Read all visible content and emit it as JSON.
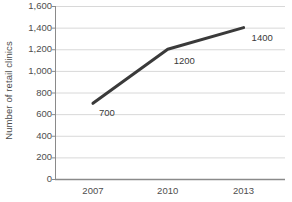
{
  "chart_data": {
    "type": "line",
    "title": "",
    "subtitle": "",
    "xlabel": "",
    "ylabel": "Number of retail clinics",
    "categories": [
      "2007",
      "2010",
      "2013"
    ],
    "x": [
      2007,
      2010,
      2013
    ],
    "values": [
      700,
      1200,
      1400
    ],
    "point_labels": [
      "700",
      "1200",
      "1400"
    ],
    "series": [
      {
        "name": "Number of retail clinics",
        "values": [
          700,
          1200,
          1400
        ]
      }
    ],
    "ylim": [
      0,
      1600
    ],
    "ytick_values": [
      0,
      200,
      400,
      600,
      800,
      1000,
      1200,
      1400,
      1600
    ],
    "ytick_labels": [
      "0",
      "200",
      "400",
      "600",
      "800",
      "1,000",
      "1,200",
      "1,400",
      "1,600"
    ],
    "xtick_labels": [
      "2007",
      "2010",
      "2013"
    ],
    "grid": "horizontal",
    "legend": "none",
    "colors": {
      "line": "#3a3a3a",
      "gridline": "#d8d8d8",
      "axis": "#8a8a8a",
      "label_text": "#4e4e4e",
      "background": "#ffffff"
    }
  },
  "axis_titles": {
    "y": "Number of retail clinics"
  },
  "point_annotations": [
    {
      "label": "700",
      "value": 700
    },
    {
      "label": "1200",
      "value": 1200
    },
    {
      "label": "1400",
      "value": 1400
    }
  ]
}
